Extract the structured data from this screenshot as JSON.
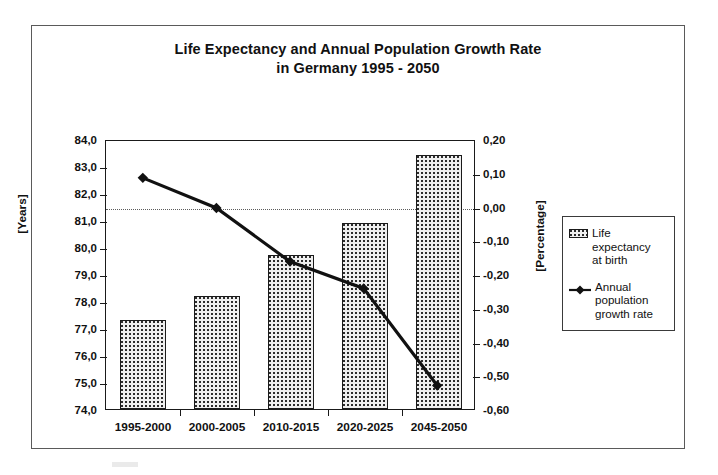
{
  "chart_data": {
    "type": "bar",
    "title": "Life Expectancy and Annual Population Growth Rate in Germany 1995 - 2050",
    "title_line1": "Life Expectancy and Annual Population Growth Rate",
    "title_line2": "in Germany 1995 - 2050",
    "categories": [
      "1995-2000",
      "2000-2005",
      "2010-2015",
      "2020-2025",
      "2045-2050"
    ],
    "xlabel": "",
    "ylabel": "[Years]",
    "y2label": "[Percentage]",
    "ylim": [
      74.0,
      84.0
    ],
    "y2lim": [
      -0.6,
      0.2
    ],
    "ytick_labels": [
      "84,0",
      "83,0",
      "82,0",
      "81,0",
      "80,0",
      "79,0",
      "78,0",
      "77,0",
      "76,0",
      "75,0",
      "74,0"
    ],
    "ytick_values": [
      84.0,
      83.0,
      82.0,
      81.0,
      80.0,
      79.0,
      78.0,
      77.0,
      76.0,
      75.0,
      74.0
    ],
    "y2tick_labels": [
      "0,20",
      "0,10",
      "0,00",
      "-0,10",
      "-0,20",
      "-0,30",
      "-0,40",
      "-0,50",
      "-0,60"
    ],
    "y2tick_values": [
      0.2,
      0.1,
      0.0,
      -0.1,
      -0.2,
      -0.3,
      -0.4,
      -0.5,
      -0.6
    ],
    "grid": false,
    "zero_reference_line": 0.0,
    "legend_position": "right",
    "series": [
      {
        "name": "Life expectancy at birth",
        "type": "bar",
        "axis": "left",
        "values": [
          77.3,
          78.2,
          79.7,
          80.9,
          83.4
        ]
      },
      {
        "name": "Annual population growth rate",
        "type": "line",
        "axis": "right",
        "marker": "diamond",
        "values": [
          0.09,
          0.0,
          -0.16,
          -0.24,
          -0.53
        ]
      }
    ]
  },
  "legend": {
    "items": [
      {
        "label_line1": "Life",
        "label_line2": "expectancy",
        "label_line3": "at birth",
        "marker": "hatched-square"
      },
      {
        "label_line1": "Annual",
        "label_line2": "population",
        "label_line3": "growth rate",
        "marker": "diamond-line"
      }
    ]
  }
}
